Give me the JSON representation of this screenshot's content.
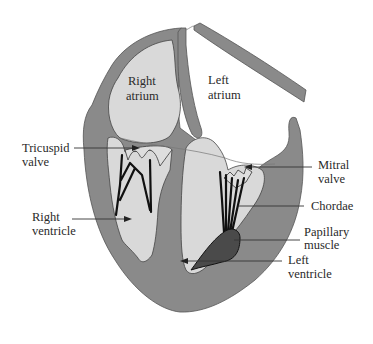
{
  "diagram": {
    "colors": {
      "wall": "#8a8a8a",
      "chamber": "#d9d9d9",
      "papillary_muscle": "#4a4a4a",
      "chordae": "#111111",
      "background": "#ffffff"
    },
    "labels": {
      "right_atrium_line1": "Right",
      "right_atrium_line2": "atrium",
      "left_atrium_line1": "Left",
      "left_atrium_line2": "atrium",
      "tricuspid_line1": "Tricuspid",
      "tricuspid_line2": "valve",
      "right_ventricle_line1": "Right",
      "right_ventricle_line2": "ventricle",
      "mitral_line1": "Mitral",
      "mitral_line2": "valve",
      "chordae": "Chordae",
      "papillary_line1": "Papillary",
      "papillary_line2": "muscle",
      "left_ventricle_line1": "Left",
      "left_ventricle_line2": "ventricle"
    }
  }
}
